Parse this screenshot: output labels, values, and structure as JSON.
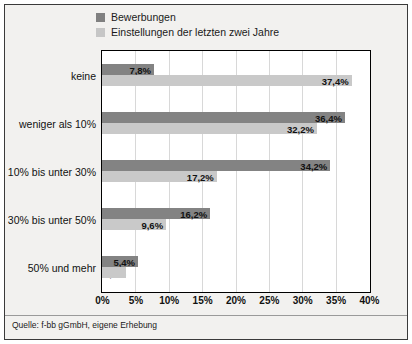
{
  "chart_data": {
    "type": "bar",
    "orientation": "horizontal",
    "title": "",
    "xlabel": "",
    "ylabel": "",
    "xlim": [
      0,
      40
    ],
    "xticks": [
      "0%",
      "5%",
      "10%",
      "15%",
      "20%",
      "25%",
      "30%",
      "35%",
      "40%"
    ],
    "xtick_values": [
      0,
      5,
      10,
      15,
      20,
      25,
      30,
      35,
      40
    ],
    "grid": true,
    "grid_axis": "x",
    "legend_position": "top",
    "categories": [
      "keine",
      "weniger als 10%",
      "10% bis unter 30%",
      "30% bis unter 50%",
      "50% und mehr"
    ],
    "series": [
      {
        "name": "Bewerbungen",
        "color": "#838383",
        "values": [
          7.8,
          36.4,
          34.2,
          16.2,
          5.4
        ],
        "labels": [
          "7,8%",
          "36,4%",
          "34,2%",
          "16,2%",
          "5,4%"
        ]
      },
      {
        "name": "Einstellungen der letzten zwei Jahre",
        "color": "#c9c9c9",
        "values": [
          37.4,
          32.2,
          17.2,
          9.6,
          3.6
        ],
        "labels": [
          "37,4%",
          "32,2%",
          "17,2%",
          "9,6%",
          "3,6%"
        ]
      }
    ]
  },
  "legend": {
    "items": [
      {
        "label": "Bewerbungen",
        "color": "#838383"
      },
      {
        "label": "Einstellungen der letzten zwei Jahre",
        "color": "#c9c9c9"
      }
    ]
  },
  "source": {
    "text": "Quelle: f-bb gGmbH, eigene Erhebung"
  },
  "colors": {
    "series_dark": "#838383",
    "series_light": "#c9c9c9",
    "frame": "#3a3a3a",
    "plot_border": "#000000",
    "page_background": "#f2f1ef",
    "plot_background": "#ffffff",
    "gridline": "#d8d8d8"
  }
}
